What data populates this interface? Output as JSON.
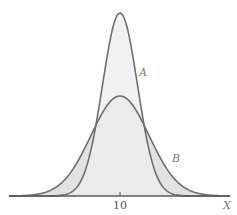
{
  "chart_data": {
    "type": "area",
    "title": "",
    "xlabel": "X",
    "ylabel": "",
    "grid": false,
    "legend": "none",
    "x_ticks": [
      {
        "value": 10,
        "label": "10"
      }
    ],
    "xlim": [
      6,
      14
    ],
    "series": [
      {
        "name": "A",
        "label": "A",
        "shape": "normal",
        "mean": 10,
        "relative_spread": "narrow",
        "relative_peak_height": 1.0,
        "px_sigma": 17.5,
        "px_peak": 183,
        "fill": "#ededed",
        "stroke": "#6e6e6e",
        "label_pos": [
          139,
          76
        ]
      },
      {
        "name": "B",
        "label": "B",
        "shape": "normal",
        "mean": 10,
        "relative_spread": "wide",
        "relative_peak_height": 0.55,
        "px_sigma": 29,
        "px_peak": 100,
        "fill": "#e2e2e2",
        "stroke": "#6e6e6e",
        "label_pos": [
          172,
          162
        ]
      }
    ],
    "annotations": [
      "A",
      "B"
    ]
  },
  "axis": {
    "x_label": "X",
    "tick_label": "10",
    "origin_px": [
      9,
      196
    ],
    "end_px": 230,
    "center_px": 120
  }
}
